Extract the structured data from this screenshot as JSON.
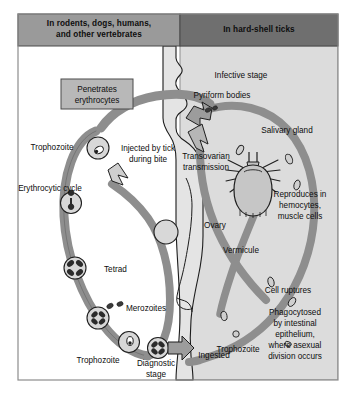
{
  "figure": {
    "panels": {
      "left": {
        "label": "In rodents, dogs, humans,\nand other vertebrates",
        "line1": "In rodents, dogs, humans,",
        "line2": "and other vertebrates",
        "fill": "#9a9a9a"
      },
      "right": {
        "label": "In hard-shell ticks",
        "fill": "#6f6f6f"
      }
    },
    "callout_box": {
      "line1": "Penetrates",
      "line2": "erythrocytes",
      "fill": "#b8b8b8"
    },
    "left_labels": [
      {
        "id": "trophozoite-top",
        "text": "Trophozoite"
      },
      {
        "id": "erythrocytic-cycle",
        "text": "Erythrocytic cycle"
      },
      {
        "id": "tetrad",
        "text": "Tetrad"
      },
      {
        "id": "merozoites",
        "text": "Merozoites"
      },
      {
        "id": "trophozoite-bottom",
        "text": "Trophozoite"
      },
      {
        "id": "diagnostic-stage",
        "line1": "Diagnostic",
        "line2": "stage"
      },
      {
        "id": "injected-by-tick",
        "line1": "Injected by tick",
        "line2": "during bite"
      }
    ],
    "right_labels": [
      {
        "id": "infective-stage",
        "text": "Infective stage"
      },
      {
        "id": "pyriform-bodies",
        "text": "Pyriform bodies"
      },
      {
        "id": "salivary-gland",
        "text": "Salivary gland"
      },
      {
        "id": "transovarian-transmission",
        "line1": "Transovarian",
        "line2": "transmission"
      },
      {
        "id": "reproduces",
        "line1": "Reproduces in",
        "line2": "hemocytes,",
        "line3": "muscle cells"
      },
      {
        "id": "ovary",
        "text": "Ovary"
      },
      {
        "id": "vermicule",
        "text": "Vermicule"
      },
      {
        "id": "cell-ruptures",
        "text": "Cell ruptures"
      },
      {
        "id": "phagocytosed",
        "line1": "Phagocytosed",
        "line2": "by intestinal",
        "line3": "epithelium,",
        "line4": "where asexual",
        "line5": "division occurs"
      },
      {
        "id": "trophozoite-tick",
        "text": "Trophozoite"
      },
      {
        "id": "ingested",
        "text": "Ingested"
      }
    ],
    "colors": {
      "page_background": "#ffffff",
      "panel_right_background": "#dcdcdc",
      "banner_left": "#9a9a9a",
      "banner_right": "#6f6f6f",
      "box": "#b8b8b8",
      "cycle_band": "#8e8e8e",
      "cycle_band_dark": "#6e6e6e",
      "cell_fill": "#d8d8d8",
      "silhouette": "#e4e4e4",
      "outline": "#1a1a1a",
      "text": "#101010"
    }
  }
}
